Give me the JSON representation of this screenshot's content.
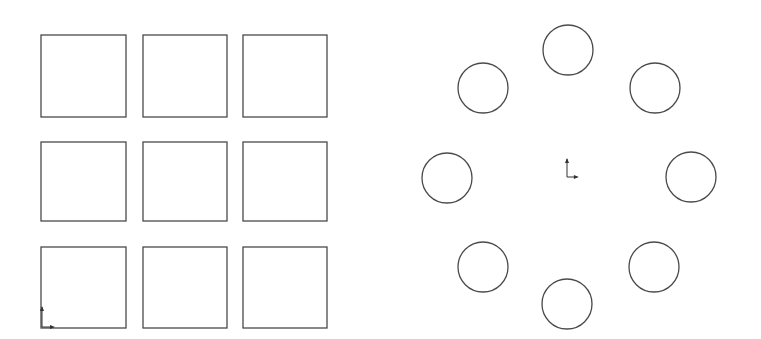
{
  "diagram": {
    "stroke_color": "#4a4a4a",
    "background": "#ffffff",
    "left_panel": {
      "name": "rectangular-pattern",
      "type": "grid of squares",
      "rows": 3,
      "columns": 3,
      "squares": [
        {
          "row": 1,
          "col": 1,
          "x": 41,
          "y": 35,
          "w": 85,
          "h": 82
        },
        {
          "row": 1,
          "col": 2,
          "x": 143,
          "y": 35,
          "w": 84,
          "h": 82
        },
        {
          "row": 1,
          "col": 3,
          "x": 243,
          "y": 35,
          "w": 84,
          "h": 82
        },
        {
          "row": 2,
          "col": 1,
          "x": 41,
          "y": 142,
          "w": 85,
          "h": 79
        },
        {
          "row": 2,
          "col": 2,
          "x": 143,
          "y": 142,
          "w": 84,
          "h": 79
        },
        {
          "row": 2,
          "col": 3,
          "x": 243,
          "y": 142,
          "w": 84,
          "h": 79
        },
        {
          "row": 3,
          "col": 1,
          "x": 41,
          "y": 247,
          "w": 85,
          "h": 81
        },
        {
          "row": 3,
          "col": 2,
          "x": 143,
          "y": 247,
          "w": 84,
          "h": 81
        },
        {
          "row": 3,
          "col": 3,
          "x": 243,
          "y": 247,
          "w": 84,
          "h": 81
        }
      ],
      "origin_marker": {
        "x": 42,
        "y": 327
      }
    },
    "right_panel": {
      "name": "circular-pattern",
      "type": "circles arranged on a ring",
      "count": 8,
      "radius": 25,
      "circles": [
        {
          "position": "top",
          "cx": 568,
          "cy": 50
        },
        {
          "position": "top-right",
          "cx": 655,
          "cy": 88
        },
        {
          "position": "right",
          "cx": 691,
          "cy": 177
        },
        {
          "position": "bottom-right",
          "cx": 654,
          "cy": 267
        },
        {
          "position": "bottom",
          "cx": 567,
          "cy": 304
        },
        {
          "position": "bottom-left",
          "cx": 483,
          "cy": 267
        },
        {
          "position": "left",
          "cx": 447,
          "cy": 178
        },
        {
          "position": "top-left",
          "cx": 483,
          "cy": 88
        }
      ],
      "origin_marker": {
        "x": 567,
        "y": 177
      }
    }
  }
}
